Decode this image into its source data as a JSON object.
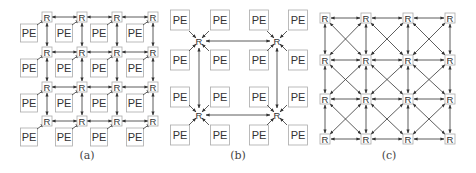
{
  "colors": {
    "line": "#333333",
    "box_border": "#aaaaaa",
    "text": "#333333",
    "caption": "#444444"
  },
  "labels": {
    "router": "R",
    "pe": "PE"
  },
  "panels": [
    {
      "id": "a",
      "caption": "(a)",
      "caption_pos": [
        87,
        157
      ],
      "description": "4x4 2D mesh, one PE per router",
      "router_x": [
        47,
        82,
        117,
        153
      ],
      "router_y": [
        17,
        52,
        87,
        121
      ]
    },
    {
      "id": "b",
      "caption": "(b)",
      "caption_pos": [
        238,
        157
      ],
      "description": "2x2 concentrated mesh, four PEs per router",
      "routers": [
        [
          199,
          41
        ],
        [
          277,
          41
        ],
        [
          199,
          115
        ],
        [
          277,
          115
        ]
      ],
      "pe_x": [
        180,
        220,
        259,
        298
      ],
      "pe_y": [
        20,
        60,
        97,
        135
      ]
    },
    {
      "id": "c",
      "caption": "(c)",
      "caption_pos": [
        389,
        157
      ],
      "description": "4x4 mesh with diagonal links, routers only",
      "router_x": [
        325,
        366,
        408,
        450
      ],
      "router_y": [
        18,
        60,
        99,
        139
      ]
    }
  ]
}
